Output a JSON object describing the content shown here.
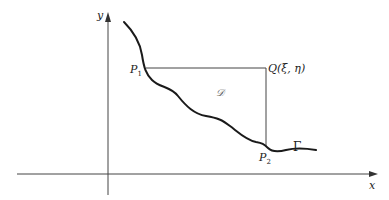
{
  "figure": {
    "type": "region-under-curve diagram",
    "axes": {
      "x_label": "x",
      "y_label": "y"
    },
    "points": {
      "p1": {
        "name": "P",
        "sub": "1"
      },
      "p2": {
        "name": "P",
        "sub": "2"
      },
      "q": {
        "label": "Q(ξ, η)"
      }
    },
    "curve_label": "Γ",
    "region_label": "𝒟",
    "colors": {
      "stroke": "#222222",
      "thin": "#444444",
      "background": "#ffffff"
    }
  }
}
